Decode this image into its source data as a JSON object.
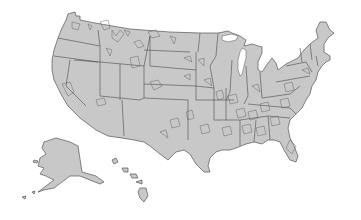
{
  "map": {
    "title": "",
    "subject": "United States with state boundaries and highlighted sub-state regions",
    "colors": {
      "background": "#ffffff",
      "land_fill": "#c8c8c8",
      "outline": "#555555"
    },
    "areas": [
      {
        "name": "contiguous-us"
      },
      {
        "name": "alaska"
      },
      {
        "name": "hawaii"
      }
    ]
  }
}
